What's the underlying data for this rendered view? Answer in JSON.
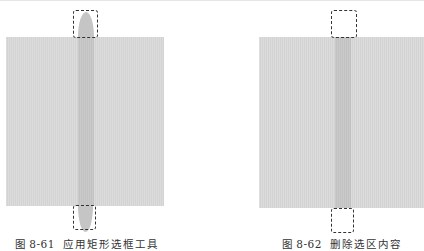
{
  "figures": [
    {
      "id": "fig-8-61",
      "number": "图 8-61",
      "title": "应用矩形选框工具",
      "colors": {
        "background_rect": "#d7d7d7",
        "stripe": "#c5c5c5",
        "selection_border": "#333333"
      }
    },
    {
      "id": "fig-8-62",
      "number": "图 8-62",
      "title": "删除选区内容",
      "colors": {
        "background_rect": "#d7d7d7",
        "stripe": "#c5c5c5",
        "selection_border": "#333333"
      }
    }
  ]
}
